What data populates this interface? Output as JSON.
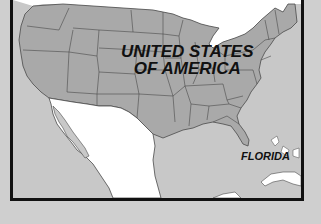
{
  "map": {
    "title": "United States Map",
    "labels": {
      "country_line1": "UNITED STATES",
      "country_line2": "OF AMERICA",
      "state": "FLORIDA"
    },
    "colors": {
      "land_usa": "#a9a9a9",
      "land_mexico": "#ffffff",
      "water": "#c8c8c8",
      "canada": "#ffffff",
      "border": "#4a4a4a",
      "frame": "#111111",
      "background": "#cfcfcf"
    }
  }
}
